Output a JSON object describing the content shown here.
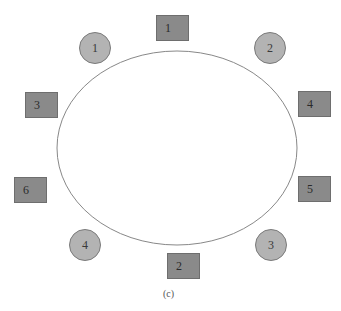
{
  "diagram": {
    "caption": "(c)",
    "ellipse": {
      "cx": 177,
      "cy": 148,
      "rx": 120,
      "ry": 97,
      "stroke": "#888888"
    },
    "colors": {
      "square_fill": "#8a8a8a",
      "circle_fill": "#b3b3b3"
    },
    "squares": [
      {
        "label": "1",
        "x": 156,
        "y": 15
      },
      {
        "label": "2",
        "x": 167,
        "y": 253
      },
      {
        "label": "3",
        "x": 25,
        "y": 92
      },
      {
        "label": "4",
        "x": 298,
        "y": 91
      },
      {
        "label": "5",
        "x": 298,
        "y": 176
      },
      {
        "label": "6",
        "x": 14,
        "y": 177
      }
    ],
    "circles": [
      {
        "label": "1",
        "cx": 95,
        "cy": 48
      },
      {
        "label": "2",
        "cx": 270,
        "cy": 48
      },
      {
        "label": "3",
        "cx": 271,
        "cy": 245
      },
      {
        "label": "4",
        "cx": 85,
        "cy": 245
      }
    ]
  }
}
